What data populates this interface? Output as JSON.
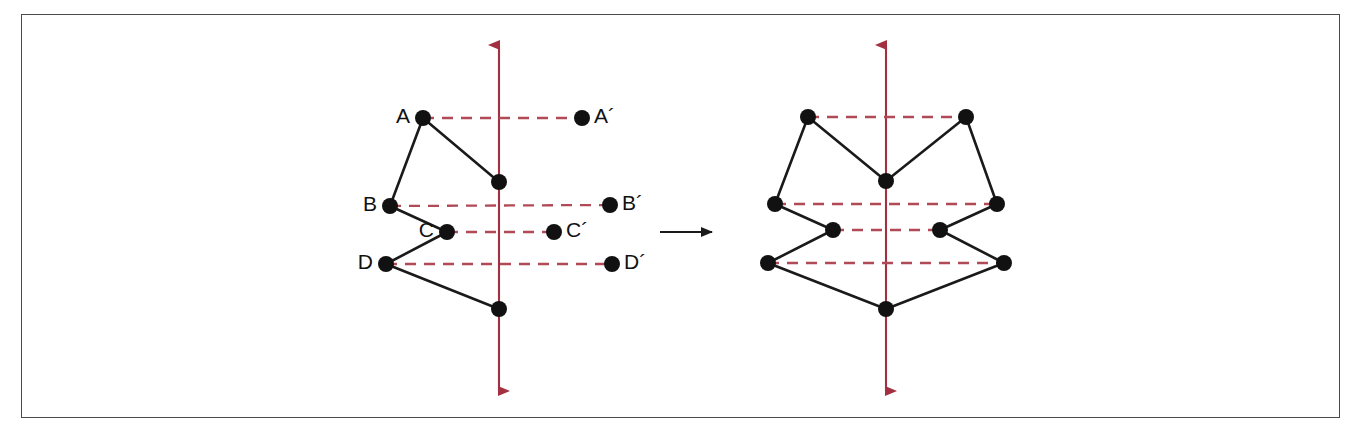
{
  "figure": {
    "type": "geometry-diagram",
    "canvas": {
      "width": 1351,
      "height": 434
    },
    "frame": {
      "x": 21,
      "y": 14,
      "width": 1319,
      "height": 404,
      "stroke": "#4a4a4a",
      "stroke_width": 1.6
    },
    "colors": {
      "axis": "#a33040",
      "dash": "#b04a56",
      "shape_stroke": "#1a1a1a",
      "vertex_fill": "#111111",
      "label_text": "#111111",
      "frame": "#4a4a4a",
      "background": "#ffffff",
      "transform_arrow": "#1a1a1a"
    },
    "panels": [
      {
        "name": "original-panel",
        "axis": {
          "x": 499,
          "y_top": 45,
          "y_bottom": 391,
          "arrow_both_ends": true
        },
        "vertices": [
          {
            "id": "A",
            "label": "A",
            "x": 423,
            "y": 118,
            "label_side": "left"
          },
          {
            "id": "B",
            "label": "B",
            "x": 390,
            "y": 206,
            "label_side": "left"
          },
          {
            "id": "C",
            "label": "C",
            "x": 447,
            "y": 232,
            "label_side": "left"
          },
          {
            "id": "D",
            "label": "D",
            "x": 386,
            "y": 264,
            "label_side": "left"
          },
          {
            "id": "V1",
            "label": "",
            "x": 499,
            "y": 182,
            "label_side": "none"
          },
          {
            "id": "V2",
            "label": "",
            "x": 499,
            "y": 309,
            "label_side": "none"
          }
        ],
        "image_points": [
          {
            "id": "A2",
            "label": "A´",
            "x": 582,
            "y": 118,
            "label_side": "right"
          },
          {
            "id": "B2",
            "label": "B´",
            "x": 610,
            "y": 205,
            "label_side": "right"
          },
          {
            "id": "C2",
            "label": "C´",
            "x": 554,
            "y": 232,
            "label_side": "right"
          },
          {
            "id": "D2",
            "label": "D´",
            "x": 612,
            "y": 264,
            "label_side": "right"
          }
        ],
        "edges": [
          {
            "from": "V1",
            "to": "A"
          },
          {
            "from": "A",
            "to": "B"
          },
          {
            "from": "B",
            "to": "C"
          },
          {
            "from": "C",
            "to": "D"
          },
          {
            "from": "D",
            "to": "V2"
          }
        ],
        "dashed_connectors": [
          {
            "from": "A",
            "to": "A2"
          },
          {
            "from": "B",
            "to": "B2"
          },
          {
            "from": "C",
            "to": "C2"
          },
          {
            "from": "D",
            "to": "D2"
          }
        ]
      },
      {
        "name": "reflected-panel",
        "axis": {
          "x": 886,
          "y_top": 45,
          "y_bottom": 391,
          "arrow_both_ends": true
        },
        "vertices": [
          {
            "id": "A",
            "label": "",
            "x": 808,
            "y": 117
          },
          {
            "id": "B",
            "label": "",
            "x": 775,
            "y": 204
          },
          {
            "id": "C",
            "label": "",
            "x": 833,
            "y": 230
          },
          {
            "id": "D",
            "label": "",
            "x": 768,
            "y": 263
          },
          {
            "id": "V1",
            "label": "",
            "x": 886,
            "y": 181
          },
          {
            "id": "V2",
            "label": "",
            "x": 886,
            "y": 309
          },
          {
            "id": "A2",
            "label": "",
            "x": 966,
            "y": 117
          },
          {
            "id": "B2",
            "label": "",
            "x": 997,
            "y": 204
          },
          {
            "id": "C2",
            "label": "",
            "x": 940,
            "y": 230
          },
          {
            "id": "D2",
            "label": "",
            "x": 1004,
            "y": 263
          }
        ],
        "edges": [
          {
            "from": "V1",
            "to": "A"
          },
          {
            "from": "A",
            "to": "B"
          },
          {
            "from": "B",
            "to": "C"
          },
          {
            "from": "C",
            "to": "D"
          },
          {
            "from": "D",
            "to": "V2"
          },
          {
            "from": "V1",
            "to": "A2"
          },
          {
            "from": "A2",
            "to": "B2"
          },
          {
            "from": "B2",
            "to": "C2"
          },
          {
            "from": "C2",
            "to": "D2"
          },
          {
            "from": "D2",
            "to": "V2"
          }
        ],
        "dashed_connectors": [
          {
            "from": "A",
            "to": "A2"
          },
          {
            "from": "B",
            "to": "B2"
          },
          {
            "from": "C",
            "to": "C2"
          },
          {
            "from": "D",
            "to": "D2"
          }
        ]
      }
    ],
    "transform_arrow": {
      "x1": 660,
      "y1": 232,
      "x2": 712,
      "y2": 232,
      "direction": "right"
    },
    "vertex_radius": 8,
    "dash_pattern": "11 8",
    "label_font_size": 21
  }
}
